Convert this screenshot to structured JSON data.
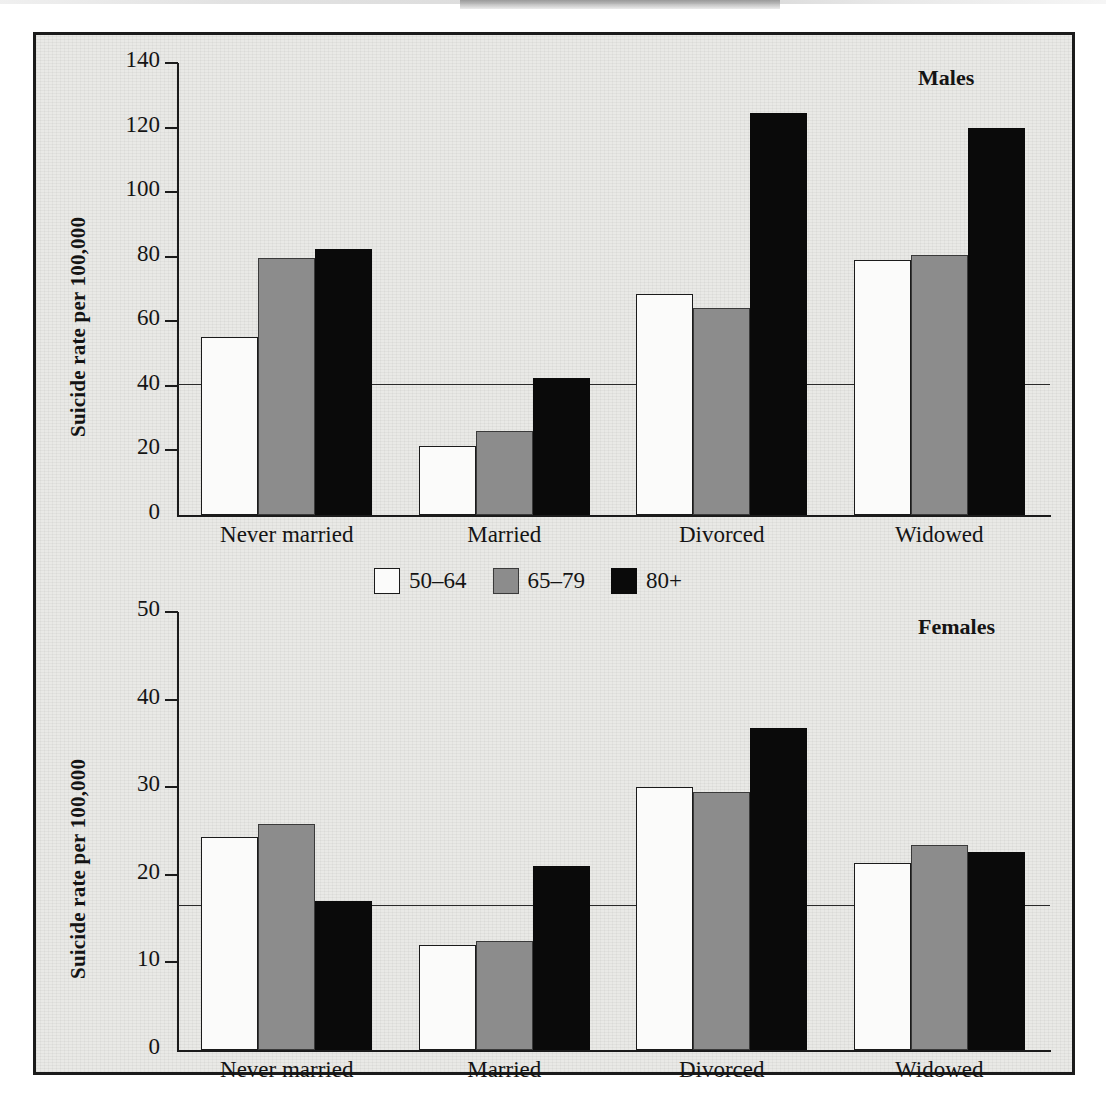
{
  "figure": {
    "panels": [
      {
        "key": "males",
        "label": "Males"
      },
      {
        "key": "females",
        "label": "Females"
      }
    ],
    "legend": {
      "items": [
        {
          "label": "50–64",
          "swatch": "white",
          "color": "#fbfbfa"
        },
        {
          "label": "65–79",
          "swatch": "gray",
          "color": "#8c8c8c"
        },
        {
          "label": "80+",
          "swatch": "black",
          "color": "#0a0a0a"
        }
      ]
    }
  },
  "chart_data": [
    {
      "type": "bar",
      "title": "Males",
      "xlabel": "",
      "ylabel": "Suicide rate per 100,000",
      "ylim": [
        0,
        140
      ],
      "yticks": [
        0,
        20,
        40,
        60,
        80,
        100,
        120,
        140
      ],
      "ytick_labels": [
        "0",
        "20",
        "40",
        "60",
        "80",
        "100",
        "120",
        "140"
      ],
      "grid": false,
      "legend_position": "center-between-panels",
      "categories": [
        "Never married",
        "Married",
        "Divorced",
        "Widowed"
      ],
      "series": [
        {
          "name": "50–64",
          "color": "#fbfbfa",
          "values": [
            55,
            21.5,
            68.5,
            79
          ]
        },
        {
          "name": "65–79",
          "color": "#8c8c8c",
          "values": [
            79.5,
            26,
            64,
            80.5
          ]
        },
        {
          "name": "80+",
          "color": "#0a0a0a",
          "values": [
            82.5,
            42.5,
            124.5,
            120
          ]
        }
      ],
      "reference_line": {
        "value": 40.5,
        "label": ""
      }
    },
    {
      "type": "bar",
      "title": "Females",
      "xlabel": "",
      "ylabel": "Suicide rate per 100,000",
      "ylim": [
        0,
        50
      ],
      "yticks": [
        0,
        10,
        20,
        30,
        40,
        50
      ],
      "ytick_labels": [
        "0",
        "10",
        "20",
        "30",
        "40",
        "50"
      ],
      "grid": false,
      "legend_position": "center-between-panels",
      "categories": [
        "Never married",
        "Married",
        "Divorced",
        "Widowed"
      ],
      "series": [
        {
          "name": "50–64",
          "color": "#fbfbfa",
          "values": [
            24.3,
            12,
            30,
            21.3
          ]
        },
        {
          "name": "65–79",
          "color": "#8c8c8c",
          "values": [
            25.8,
            12.4,
            29.4,
            23.4
          ]
        },
        {
          "name": "80+",
          "color": "#0a0a0a",
          "values": [
            17,
            21,
            36.8,
            22.6
          ]
        }
      ],
      "reference_line": {
        "value": 16.5,
        "label": ""
      }
    }
  ]
}
